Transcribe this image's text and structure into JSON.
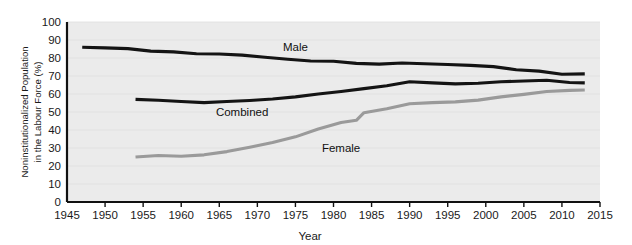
{
  "page": {
    "clipped_top_text": ""
  },
  "chart_data": {
    "type": "line",
    "title": "",
    "xlabel": "Year",
    "ylabel": "Noninstitutionalized Population in the Labour Force (%)",
    "ylabel_line1": "Noninstitutionalized Population",
    "ylabel_line2": "in the Labour Force (%)",
    "xlim": [
      1945,
      2015
    ],
    "ylim": [
      0,
      100
    ],
    "xticks": [
      1945,
      1950,
      1955,
      1960,
      1965,
      1970,
      1975,
      1980,
      1985,
      1990,
      1995,
      2000,
      2005,
      2010,
      2015
    ],
    "yticks": [
      0,
      10,
      20,
      30,
      40,
      50,
      60,
      70,
      80,
      90,
      100
    ],
    "grid": "horizontal-faint",
    "legend": "inline-labels",
    "plot_background": "#ebebeb",
    "series": [
      {
        "name": "Male",
        "color": "#141414",
        "label_x": 1975,
        "label_y": 86,
        "x": [
          1947,
          1950,
          1953,
          1956,
          1959,
          1962,
          1965,
          1968,
          1971,
          1974,
          1977,
          1980,
          1983,
          1986,
          1989,
          1992,
          1995,
          1998,
          2001,
          2004,
          2007,
          2010,
          2013
        ],
        "values": [
          86.0,
          85.6,
          85.2,
          83.8,
          83.4,
          82.4,
          82.2,
          81.6,
          80.4,
          79.3,
          78.3,
          78.2,
          77.0,
          76.6,
          77.2,
          76.8,
          76.4,
          75.9,
          75.2,
          73.5,
          72.7,
          71.0,
          71.2
        ]
      },
      {
        "name": "Combined",
        "color": "#141414",
        "label_x": 1968,
        "label_y": 50,
        "x": [
          1954,
          1957,
          1960,
          1963,
          1966,
          1969,
          1972,
          1975,
          1978,
          1981,
          1984,
          1987,
          1990,
          1993,
          1996,
          1999,
          2002,
          2005,
          2008,
          2011,
          2013
        ],
        "values": [
          57.0,
          56.5,
          55.8,
          55.2,
          55.8,
          56.4,
          57.2,
          58.4,
          60.0,
          61.4,
          63.0,
          64.6,
          66.8,
          66.2,
          65.6,
          66.0,
          66.8,
          67.2,
          67.6,
          66.4,
          66.2
        ]
      },
      {
        "name": "Female",
        "color": "#9a9a9a",
        "label_x": 1981,
        "label_y": 30,
        "x": [
          1954,
          1957,
          1960,
          1963,
          1966,
          1969,
          1972,
          1975,
          1978,
          1981,
          1983,
          1984,
          1987,
          1990,
          1993,
          1996,
          1999,
          2002,
          2005,
          2008,
          2011,
          2013
        ],
        "values": [
          25.0,
          25.8,
          25.4,
          26.2,
          28.0,
          30.4,
          33.0,
          36.2,
          40.6,
          44.2,
          45.4,
          49.6,
          51.8,
          54.6,
          55.2,
          55.6,
          56.6,
          58.4,
          59.8,
          61.4,
          62.0,
          62.2
        ]
      }
    ]
  }
}
